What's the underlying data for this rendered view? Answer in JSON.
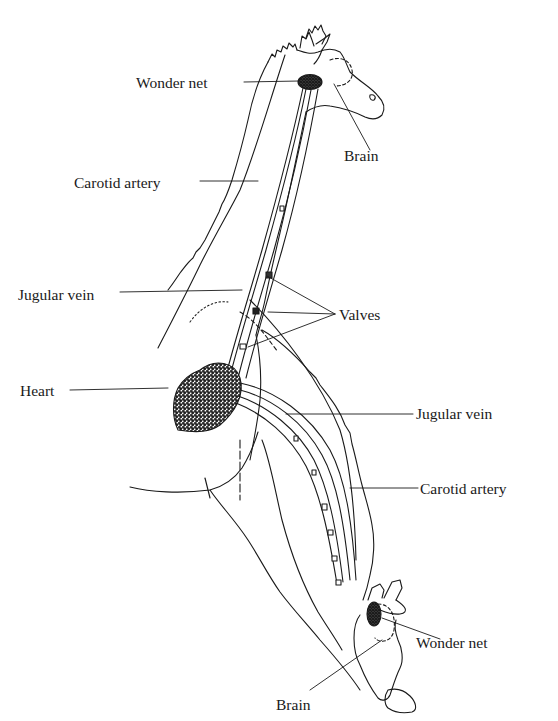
{
  "figure": {
    "ink_color": "#1a1a1a",
    "background": "#ffffff"
  },
  "labels": {
    "top": {
      "wonder_net": "Wonder net",
      "brain": "Brain",
      "carotid_artery": "Carotid artery",
      "jugular_vein": "Jugular vein",
      "valves": "Valves",
      "heart": "Heart"
    },
    "bottom": {
      "jugular_vein": "Jugular vein",
      "carotid_artery": "Carotid artery",
      "wonder_net": "Wonder net",
      "brain": "Brain"
    }
  }
}
